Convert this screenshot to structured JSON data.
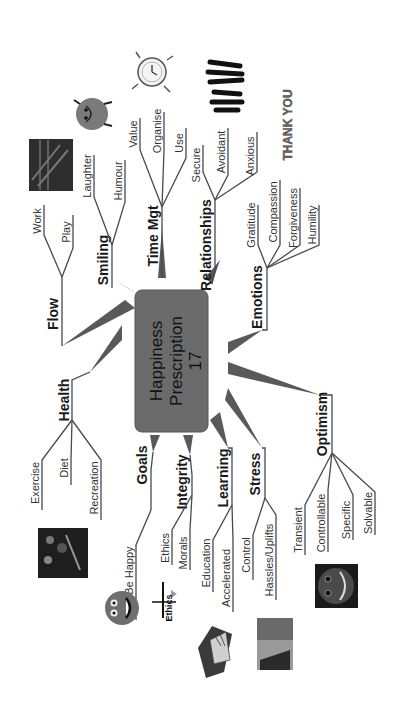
{
  "center": {
    "line1": "Happiness",
    "line2": "Prescription",
    "line3": "17",
    "fill": "#6b6b6b"
  },
  "branches": [
    {
      "label": "Flow",
      "children": [
        "Work",
        "Play"
      ]
    },
    {
      "label": "Smiling",
      "children": [
        "Laughter",
        "Humour"
      ]
    },
    {
      "label": "Time Mgt",
      "children": [
        "Value",
        "Organise",
        "Use"
      ]
    },
    {
      "label": "Relationships",
      "children": [
        "Secure",
        "Avoidant",
        "Anxious"
      ]
    },
    {
      "label": "Emotions",
      "children": [
        "Gratitude",
        "Compassion",
        "Forgiveness",
        "Humility"
      ]
    },
    {
      "label": "Health",
      "children": [
        "Exercise",
        "Diet",
        "Recreation"
      ]
    },
    {
      "label": "Goals",
      "children": [
        "To Be Happy"
      ]
    },
    {
      "label": "Integrity",
      "children": [
        "Ethics",
        "Morals"
      ]
    },
    {
      "label": "Learning",
      "children": [
        "Education",
        "Accelerated"
      ]
    },
    {
      "label": "Stress",
      "children": [
        "Control",
        "Hassles/Uplifts"
      ]
    },
    {
      "label": "Optimism",
      "children": [
        "Transient",
        "Controllable",
        "Specific",
        "Solvable"
      ]
    }
  ],
  "images": {
    "flow": "flow-photo",
    "smiling": "smiley-character",
    "time_mgt": "clock-cartoon",
    "relationships": "people-silhouettes",
    "emotions": "thank-you-text-art",
    "health": "food-photo",
    "goals": "happy-face",
    "integrity": "ethics-scales",
    "learning": "graduation-books",
    "stress": "stress-photo",
    "optimism": "smiling-face-dark",
    "ethics_caption": "Ethics",
    "thank_caption": "THANK YOU"
  }
}
